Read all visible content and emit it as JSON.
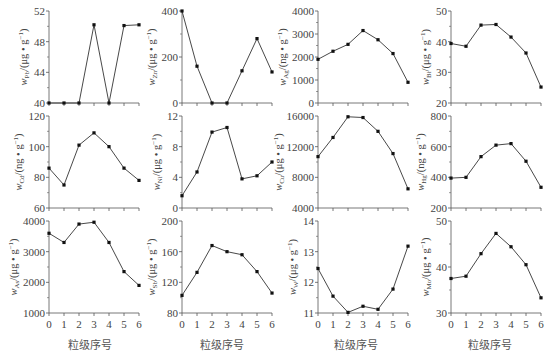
{
  "figure": {
    "xlabel": "粒级序号",
    "x_ticks": [
      "0",
      "1",
      "2",
      "3",
      "4",
      "5",
      "6"
    ]
  },
  "chart_data": [
    {
      "type": "line",
      "element": "Pb",
      "ylabel": "w_Pb/(μg·g⁻¹)",
      "unit": "μg·g⁻¹",
      "x": [
        0,
        1,
        2,
        3,
        4,
        5,
        6
      ],
      "values": [
        40,
        40,
        40,
        50.2,
        40,
        50.1,
        50.2
      ],
      "ylim": [
        40,
        52
      ],
      "yticks": [
        40,
        44,
        48,
        52
      ],
      "row": 0,
      "col": 0
    },
    {
      "type": "line",
      "element": "Zn",
      "ylabel": "w_Zn/(μg·g⁻¹)",
      "unit": "μg·g⁻¹",
      "x": [
        0,
        1,
        2,
        3,
        4,
        5,
        6
      ],
      "values": [
        400,
        160,
        0,
        0,
        140,
        280,
        135
      ],
      "ylim": [
        0,
        400
      ],
      "yticks": [
        0,
        200,
        400
      ],
      "row": 0,
      "col": 1
    },
    {
      "type": "line",
      "element": "Ag",
      "ylabel": "w_Ag/(ng·g⁻¹)",
      "unit": "ng·g⁻¹",
      "x": [
        0,
        1,
        2,
        3,
        4,
        5,
        6
      ],
      "values": [
        1900,
        2250,
        2550,
        3150,
        2750,
        2150,
        900
      ],
      "ylim": [
        0,
        4000
      ],
      "yticks": [
        0,
        1000,
        2000,
        3000,
        4000
      ],
      "row": 0,
      "col": 2
    },
    {
      "type": "line",
      "element": "Bi",
      "ylabel": "w_Bi/(μg·g⁻¹)",
      "unit": "μg·g⁻¹",
      "x": [
        0,
        1,
        2,
        3,
        4,
        5,
        6
      ],
      "values": [
        39.4,
        38.5,
        45.4,
        45.6,
        41.5,
        36.3,
        25.2
      ],
      "ylim": [
        20,
        50
      ],
      "yticks": [
        20,
        30,
        40,
        50
      ],
      "row": 0,
      "col": 3
    },
    {
      "type": "line",
      "element": "Cd",
      "ylabel": "w_Cd/(ng·g⁻¹)",
      "unit": "ng·g⁻¹",
      "x": [
        0,
        1,
        2,
        3,
        4,
        5,
        6
      ],
      "values": [
        86,
        75,
        101,
        109,
        100,
        86,
        78
      ],
      "ylim": [
        60,
        120
      ],
      "yticks": [
        60,
        80,
        100,
        120
      ],
      "row": 1,
      "col": 0
    },
    {
      "type": "line",
      "element": "Ni",
      "ylabel": "w_Ni/(μg·g⁻¹)",
      "unit": "μg·g⁻¹",
      "x": [
        0,
        1,
        2,
        3,
        4,
        5,
        6
      ],
      "values": [
        1.6,
        4.7,
        9.9,
        10.5,
        3.8,
        4.2,
        6.0
      ],
      "ylim": [
        0,
        12
      ],
      "yticks": [
        0,
        4,
        8,
        12
      ],
      "row": 1,
      "col": 1
    },
    {
      "type": "line",
      "element": "Cu",
      "ylabel": "w_Cu/(μg·g⁻¹)",
      "unit": "μg·g⁻¹",
      "x": [
        0,
        1,
        2,
        3,
        4,
        5,
        6
      ],
      "values": [
        10700,
        13200,
        15900,
        15800,
        14000,
        11100,
        6500
      ],
      "ylim": [
        4000,
        16000
      ],
      "yticks": [
        4000,
        8000,
        12000,
        16000
      ],
      "row": 1,
      "col": 2
    },
    {
      "type": "line",
      "element": "Hg",
      "ylabel": "w_Hg/(ng·g⁻¹)",
      "unit": "ng·g⁻¹",
      "x": [
        0,
        1,
        2,
        3,
        4,
        5,
        6
      ],
      "values": [
        395,
        400,
        535,
        610,
        620,
        505,
        335
      ],
      "ylim": [
        200,
        800
      ],
      "yticks": [
        200,
        400,
        600,
        800
      ],
      "row": 1,
      "col": 3
    },
    {
      "type": "line",
      "element": "As",
      "ylabel": "w_As/(μg·g⁻¹)",
      "unit": "μg·g⁻¹",
      "x": [
        0,
        1,
        2,
        3,
        4,
        5,
        6
      ],
      "values": [
        3600,
        3300,
        3900,
        3960,
        3300,
        2350,
        1900
      ],
      "ylim": [
        1000,
        4000
      ],
      "yticks": [
        1000,
        2000,
        3000,
        4000
      ],
      "row": 2,
      "col": 0
    },
    {
      "type": "line",
      "element": "Sb",
      "ylabel": "w_Sb/(μg·g⁻¹)",
      "unit": "μg·g⁻¹",
      "x": [
        0,
        1,
        2,
        3,
        4,
        5,
        6
      ],
      "values": [
        103,
        133,
        168,
        160,
        156,
        134,
        106
      ],
      "ylim": [
        80,
        200
      ],
      "yticks": [
        80,
        120,
        160,
        200
      ],
      "row": 2,
      "col": 1
    },
    {
      "type": "line",
      "element": "W",
      "ylabel": "w_W/(μg·g⁻¹)",
      "unit": "μg·g⁻¹",
      "x": [
        0,
        1,
        2,
        3,
        4,
        5,
        6
      ],
      "values": [
        12.45,
        11.55,
        11.02,
        11.22,
        11.12,
        11.78,
        13.18
      ],
      "ylim": [
        11,
        14
      ],
      "yticks": [
        11,
        12,
        13,
        14
      ],
      "row": 2,
      "col": 2
    },
    {
      "type": "line",
      "element": "Mo",
      "ylabel": "w_Mo/(μg·g⁻¹)",
      "unit": "μg·g⁻¹",
      "x": [
        0,
        1,
        2,
        3,
        4,
        5,
        6
      ],
      "values": [
        37.5,
        38,
        42.9,
        47.3,
        44.4,
        40.5,
        33.3
      ],
      "ylim": [
        30,
        50
      ],
      "yticks": [
        30,
        40,
        50
      ],
      "row": 2,
      "col": 3
    }
  ],
  "colors": {
    "line": "#333333",
    "axis": "#555555",
    "text": "#444444"
  }
}
